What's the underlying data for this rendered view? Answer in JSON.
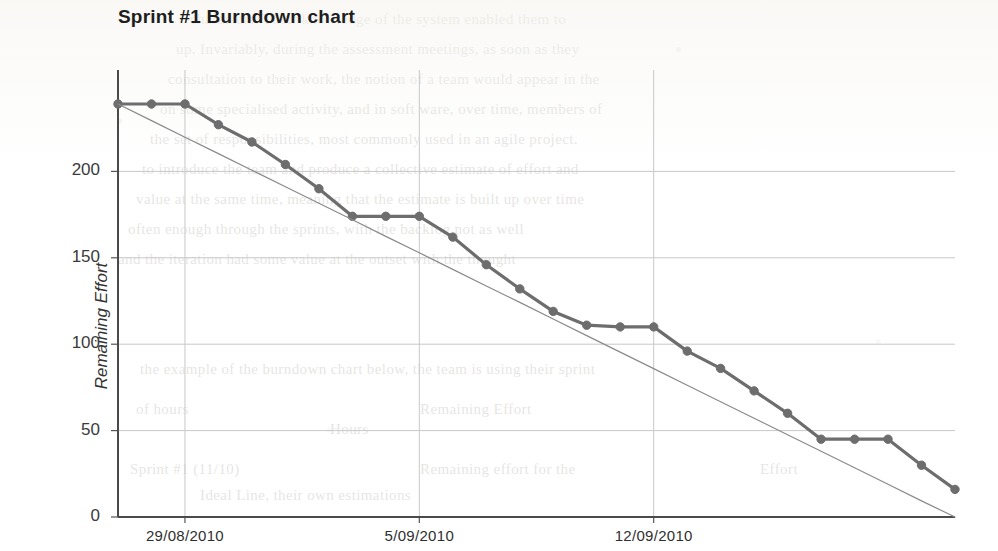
{
  "chart_data": {
    "type": "line",
    "title": "Sprint #1 Burndown chart",
    "xlabel": "",
    "ylabel": "Remaining Effort",
    "ylim": [
      0,
      250
    ],
    "yticks": [
      0,
      50,
      100,
      150,
      200
    ],
    "ytick_labels": [
      "0",
      "50",
      "100",
      "150",
      "200"
    ],
    "xtick_labels": [
      "29/08/2010",
      "5/09/2010",
      "12/09/2010"
    ],
    "xtick_days": [
      2,
      9,
      16
    ],
    "x_days": [
      0,
      1,
      2,
      3,
      4,
      5,
      6,
      7,
      8,
      9,
      10,
      11,
      12,
      13,
      14,
      15,
      16,
      17,
      18,
      19,
      20,
      21,
      22,
      23,
      24,
      25
    ],
    "grid": true,
    "legend": false,
    "series": [
      {
        "name": "Remaining Effort",
        "color": "#6d6d6d",
        "marker": "circle",
        "values": [
          239,
          239,
          239,
          227,
          217,
          204,
          190,
          174,
          174,
          174,
          162,
          146,
          132,
          119,
          111,
          110,
          110,
          96,
          86,
          73,
          60,
          45,
          45,
          45,
          30,
          16
        ]
      },
      {
        "name": "Ideal Line",
        "color": "#8a8a8a",
        "marker": "none",
        "values": [
          239,
          229.4,
          219.8,
          210.3,
          200.7,
          191.1,
          181.6,
          172.0,
          162.4,
          152.9,
          143.3,
          133.7,
          124.2,
          114.6,
          105.0,
          95.4,
          85.9,
          76.3,
          66.7,
          57.2,
          47.6,
          38.0,
          28.5,
          18.9,
          9.3,
          0
        ]
      }
    ]
  },
  "plot_geometry": {
    "left": 118,
    "right": 955,
    "top": 85,
    "bottom": 517
  },
  "paper_ghost_lines": [
    {
      "x": 190,
      "y": 2,
      "text": "characters. Their knowledge of the system enabled them to"
    },
    {
      "x": 176,
      "y": 32,
      "text": "up. Invariably, during the assessment meetings, as soon as they"
    },
    {
      "x": 168,
      "y": 62,
      "text": "consultation to their work, the notion of a team would appear in the"
    },
    {
      "x": 160,
      "y": 92,
      "text": "on some specialised activity, and in soft ware, over time, members of"
    },
    {
      "x": 150,
      "y": 122,
      "text": "the set of responsibilities, most commonly used in an agile project."
    },
    {
      "x": 142,
      "y": 152,
      "text": "to introduce the team and produce a collective estimate of effort and"
    },
    {
      "x": 136,
      "y": 182,
      "text": "value at the same time, meaning that the estimate is built up over time"
    },
    {
      "x": 128,
      "y": 212,
      "text": "often enough through the sprints, with the backlog not as well"
    },
    {
      "x": 118,
      "y": 242,
      "text": "and the iteration had some value at the outset with the thought"
    },
    {
      "x": 116,
      "y": 300,
      "text": ""
    },
    {
      "x": 140,
      "y": 352,
      "text": "the example of the burndown chart below, the team is using their sprint"
    },
    {
      "x": 136,
      "y": 392,
      "text": "of hours"
    },
    {
      "x": 420,
      "y": 392,
      "text": "Remaining Effort"
    },
    {
      "x": 330,
      "y": 412,
      "text": "Hours"
    },
    {
      "x": 130,
      "y": 452,
      "text": "Sprint #1 (11/10)"
    },
    {
      "x": 420,
      "y": 452,
      "text": "Remaining effort for the"
    },
    {
      "x": 760,
      "y": 452,
      "text": "Effort"
    },
    {
      "x": 200,
      "y": 478,
      "text": "Ideal Line, their own estimations"
    }
  ]
}
